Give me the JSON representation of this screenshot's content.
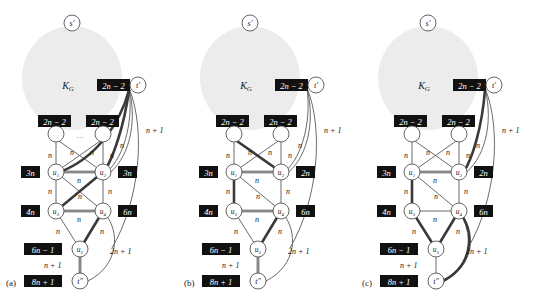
{
  "figure": {
    "type": "diagram",
    "background_color": "#ffffff",
    "blob_color": "#ececec",
    "label_box_color": "#111111",
    "label_text_color": "#ffffff",
    "node_fill": "#ffffff",
    "node_stroke": "#444444",
    "edge_color": "#555555",
    "bold_edge_color": "#3a3a3a"
  },
  "panels": [
    {
      "caption": "(a)",
      "blob_label": "K_G",
      "blob_label_display": "K",
      "blob_label_sub": "G",
      "source_node": "s′",
      "sink_node": "t′",
      "top_right_node": "t′",
      "bottom_node": "t′",
      "ellipsis": "···",
      "nodes": [
        {
          "id": "s",
          "label": "s′",
          "box": null
        },
        {
          "id": "tprime_top",
          "label": "t′",
          "box": "2n − 2"
        },
        {
          "id": "v1",
          "label": "",
          "box": "2n − 2"
        },
        {
          "id": "v2",
          "label": "",
          "box": "2n − 2"
        },
        {
          "id": "u1",
          "label": "u₁",
          "box": "3n"
        },
        {
          "id": "u2",
          "label": "u₂",
          "box": "3n"
        },
        {
          "id": "u3",
          "label": "u₃",
          "box": "4n"
        },
        {
          "id": "u4",
          "label": "u₄",
          "box": "6n"
        },
        {
          "id": "u5",
          "label": "u₅",
          "box": "6n − 1"
        },
        {
          "id": "tstar",
          "label": "t″",
          "box": "8n + 1"
        }
      ],
      "edge_labels": [
        "n + 1",
        "n",
        "n",
        "n",
        "n",
        "n",
        "n",
        "n",
        "n",
        "n",
        "n",
        "n",
        "n",
        "2n + 1",
        "n + 1"
      ],
      "bold_edges": [
        "tprime-u1",
        "tprime-u2",
        "u1-u2",
        "u1-u4",
        "u2-u3",
        "u3-u4",
        "u4-u5",
        "u5-tstar"
      ]
    },
    {
      "caption": "(b)",
      "blob_label_display": "K",
      "blob_label_sub": "G",
      "source_node": "s′",
      "nodes": [
        {
          "id": "s",
          "label": "s′",
          "box": null
        },
        {
          "id": "tprime_top",
          "label": "t′",
          "box": "2n − 2"
        },
        {
          "id": "v1",
          "label": "",
          "box": "2n − 2"
        },
        {
          "id": "v2",
          "label": "",
          "box": "2n − 2"
        },
        {
          "id": "u1",
          "label": "u₁",
          "box": "3n"
        },
        {
          "id": "u2",
          "label": "u₂",
          "box": "2n"
        },
        {
          "id": "u3",
          "label": "u₃",
          "box": "4n"
        },
        {
          "id": "u4",
          "label": "u₄",
          "box": "6n"
        },
        {
          "id": "u5",
          "label": "u₅",
          "box": "6n − 1"
        },
        {
          "id": "tstar",
          "label": "t″",
          "box": "8n + 1"
        }
      ],
      "edge_labels": [
        "n + 1",
        "n",
        "n",
        "n",
        "n",
        "n",
        "n",
        "n",
        "n",
        "n",
        "n",
        "n",
        "n",
        "2n + 1",
        "n + 1"
      ],
      "bold_edges": [
        "v1-u2",
        "u1-u2",
        "u1-u3",
        "u3-u4",
        "u4-u5",
        "u5-tstar"
      ]
    },
    {
      "caption": "(c)",
      "blob_label_display": "K",
      "blob_label_sub": "G",
      "source_node": "s′",
      "nodes": [
        {
          "id": "s",
          "label": "s′",
          "box": null
        },
        {
          "id": "tprime_top",
          "label": "t′",
          "box": "2n − 2"
        },
        {
          "id": "v1",
          "label": "",
          "box": "2n − 2"
        },
        {
          "id": "v2",
          "label": "",
          "box": "2n − 2"
        },
        {
          "id": "u1",
          "label": "u₁",
          "box": "3n"
        },
        {
          "id": "u2",
          "label": "u₂",
          "box": "2n"
        },
        {
          "id": "u3",
          "label": "u₃",
          "box": "4n"
        },
        {
          "id": "u4",
          "label": "u₄",
          "box": "6n"
        },
        {
          "id": "u5",
          "label": "u₅",
          "box": "6n − 1"
        },
        {
          "id": "tstar",
          "label": "t″",
          "box": "8n + 1"
        }
      ],
      "edge_labels": [
        "n + 1",
        "n",
        "n",
        "n",
        "n",
        "n",
        "n",
        "n",
        "n",
        "n",
        "n",
        "n",
        "n",
        "2n + 1",
        "n + 1"
      ],
      "bold_edges": [
        "tprime-u2",
        "u1-u2",
        "u1-u3",
        "u3-u5",
        "u4-u5",
        "u4-tstar",
        "u5-tstar"
      ]
    }
  ]
}
